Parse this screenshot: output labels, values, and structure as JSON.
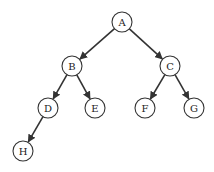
{
  "diagram": {
    "type": "binary-tree",
    "node_radius": 10,
    "colors": {
      "stroke": "#333333",
      "fill": "#ffffff",
      "text": "#222222"
    },
    "nodes": [
      {
        "id": "A",
        "label": "A",
        "x": 122,
        "y": 22
      },
      {
        "id": "B",
        "label": "B",
        "x": 72,
        "y": 66
      },
      {
        "id": "C",
        "label": "C",
        "x": 170,
        "y": 66
      },
      {
        "id": "D",
        "label": "D",
        "x": 48,
        "y": 108
      },
      {
        "id": "E",
        "label": "E",
        "x": 95,
        "y": 108
      },
      {
        "id": "F",
        "label": "F",
        "x": 145,
        "y": 108
      },
      {
        "id": "G",
        "label": "G",
        "x": 194,
        "y": 108
      },
      {
        "id": "H",
        "label": "H",
        "x": 23,
        "y": 151
      }
    ],
    "edges": [
      {
        "from": "A",
        "to": "B"
      },
      {
        "from": "A",
        "to": "C"
      },
      {
        "from": "B",
        "to": "D"
      },
      {
        "from": "B",
        "to": "E"
      },
      {
        "from": "C",
        "to": "F"
      },
      {
        "from": "C",
        "to": "G"
      },
      {
        "from": "D",
        "to": "H"
      }
    ]
  }
}
